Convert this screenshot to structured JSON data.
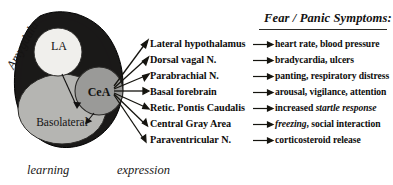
{
  "diagram": {
    "outer_label": "Amygdala",
    "regions": [
      {
        "key": "la",
        "label": "LA",
        "color": "#f0efec"
      },
      {
        "key": "cea",
        "label": "CeA",
        "color": "#9a9a98"
      },
      {
        "key": "basolateral",
        "label": "Basolateral",
        "color": "#b5b5b2"
      }
    ],
    "outline_color": "#1a1918",
    "captions": {
      "left": "learning",
      "right": "expression"
    }
  },
  "targets": {
    "items": [
      "Lateral hypothalamus",
      "Dorsal vagal N.",
      "Parabrachial N.",
      "Basal forebrain",
      "Retic. Pontis Caudalis",
      "Central Gray Area",
      "Paraventricular N."
    ]
  },
  "symptoms": {
    "title": "Fear / Panic Symptoms:",
    "items": [
      {
        "pre": "heart rate, blood pressure",
        "em": "",
        "post": ""
      },
      {
        "pre": "bradycardia, ulcers",
        "em": "",
        "post": ""
      },
      {
        "pre": "panting, respiratory distress",
        "em": "",
        "post": ""
      },
      {
        "pre": "arousal, vigilance, attention",
        "em": "",
        "post": ""
      },
      {
        "pre": "increased ",
        "em": "startle response",
        "post": ""
      },
      {
        "pre": "",
        "em": "freezing",
        "post": ", social interaction"
      },
      {
        "pre": "corticosteroid release",
        "em": "",
        "post": ""
      }
    ]
  },
  "icons": {
    "arrow": "arrow-right-icon"
  }
}
